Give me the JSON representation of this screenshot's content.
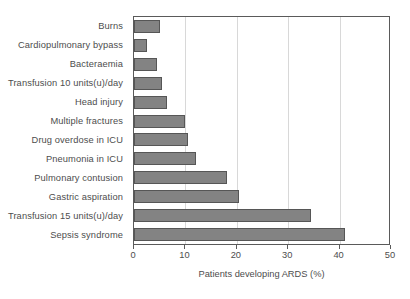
{
  "chart_data": {
    "type": "bar",
    "orientation": "horizontal",
    "title": "",
    "xlabel": "Patients developing ARDS (%)",
    "ylabel": "",
    "xlim": [
      0,
      50
    ],
    "xticks": [
      0,
      10,
      20,
      30,
      40,
      50
    ],
    "grid": "vertical",
    "legend": "none",
    "bar_color": "#838383",
    "bar_border_color": "#565656",
    "gridline_color": "#d8d8d8",
    "axis_color": "#5a5a5a",
    "text_color": "#4d4d4d",
    "categories": [
      "Burns",
      "Cardiopulmonary bypass",
      "Bacteraemia",
      "Transfusion 10 units(u)/day",
      "Head injury",
      "Multiple fractures",
      "Drug overdose in ICU",
      "Pneumonia in ICU",
      "Pulmonary contusion",
      "Gastric aspiration",
      "Transfusion 15 units(u)/day",
      "Sepsis syndrome"
    ],
    "values": [
      5,
      2.5,
      4.5,
      5.5,
      6.5,
      10,
      10.5,
      12,
      18,
      20.5,
      34.5,
      41
    ]
  }
}
